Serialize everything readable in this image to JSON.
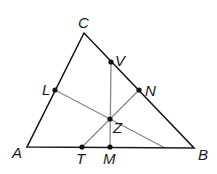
{
  "diagram": {
    "type": "triangle-with-concurrent-segments",
    "colors": {
      "triangle": "#1a1a1a",
      "segments": "#888888",
      "points": "#111111"
    },
    "vertices": {
      "A": {
        "label": "A",
        "x": 27,
        "y": 147
      },
      "B": {
        "label": "B",
        "x": 194,
        "y": 148
      },
      "C": {
        "label": "C",
        "x": 84,
        "y": 33
      }
    },
    "points": {
      "V": {
        "label": "V",
        "x": 111,
        "y": 62
      },
      "L": {
        "label": "L",
        "x": 55,
        "y": 90
      },
      "N": {
        "label": "N",
        "x": 139,
        "y": 90
      },
      "Z": {
        "label": "Z",
        "x": 110,
        "y": 119
      },
      "T": {
        "label": "T",
        "x": 82,
        "y": 147
      },
      "M": {
        "label": "M",
        "x": 110,
        "y": 147
      }
    },
    "segments": [
      {
        "name": "VM",
        "from": "V",
        "to": "M"
      },
      {
        "name": "TN",
        "from": "T",
        "to": "N"
      },
      {
        "name": "L-to-AB",
        "from": "L",
        "to_point": {
          "x": 165,
          "y": 148
        }
      }
    ],
    "labels": {
      "A": "A",
      "B": "B",
      "C": "C",
      "V": "V",
      "L": "L",
      "N": "N",
      "Z": "Z",
      "T": "T",
      "M": "M"
    }
  }
}
